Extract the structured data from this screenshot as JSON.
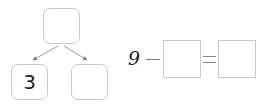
{
  "worksheet": {
    "number_bond": {
      "name": "number-bond-diagram",
      "total_value": "",
      "part_left_value": "3",
      "part_right_value": "",
      "arrow_count": 2,
      "box_border_color": "#c9c9c9",
      "arrow_color": "#8a8a8a",
      "digit_color": "#1d1d1d"
    },
    "equation": {
      "name": "subtraction-equation",
      "minuend": "9",
      "minus_symbol": "−",
      "subtrahend_value": "",
      "equals_symbol": "=",
      "difference_value": "",
      "box_border_color": "#c9c9c9",
      "digit_color": "#1a1a1a"
    }
  }
}
